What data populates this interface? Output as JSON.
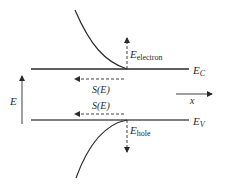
{
  "diagram": {
    "bands": {
      "conduction": {
        "symbol": "E",
        "subscript": "C"
      },
      "valence": {
        "symbol": "E",
        "subscript": "V"
      }
    },
    "labels": {
      "electron_energy": {
        "symbol": "E",
        "subscript": "electron"
      },
      "hole_energy": {
        "symbol": "E",
        "subscript": "hole"
      },
      "dos_upper": "S(E)",
      "dos_lower": "S(E)",
      "energy_axis": "E",
      "position_axis": "x"
    },
    "colors": {
      "line": "#2a2a2a",
      "band_valence": "#555555",
      "background": "#ffffff"
    }
  }
}
